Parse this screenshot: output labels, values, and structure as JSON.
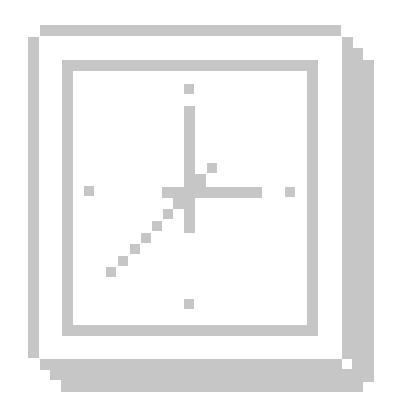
{
  "icon": {
    "name": "clock-icon",
    "style": "pixelated grayscale",
    "color": "#c6c6c6",
    "background": "#ffffff",
    "time_shown": "7:15",
    "shapes": {
      "outer_frame": [
        {
          "part": "top-bar",
          "x": 40,
          "y": 25,
          "w": 301,
          "h": 11
        },
        {
          "part": "left-bar",
          "x": 28,
          "y": 37,
          "w": 11,
          "h": 321
        },
        {
          "part": "right-shadow-1",
          "x": 342,
          "y": 37,
          "w": 11,
          "h": 322
        },
        {
          "part": "right-shadow-2",
          "x": 352,
          "y": 48,
          "w": 11,
          "h": 322
        },
        {
          "part": "right-shadow-3",
          "x": 363,
          "y": 60,
          "w": 11,
          "h": 322
        },
        {
          "part": "bottom-shadow-1",
          "x": 40,
          "y": 359,
          "w": 302,
          "h": 11
        },
        {
          "part": "bottom-shadow-2",
          "x": 50,
          "y": 369,
          "w": 313,
          "h": 11
        },
        {
          "part": "bottom-shadow-3",
          "x": 61,
          "y": 380,
          "w": 302,
          "h": 12
        }
      ],
      "inner_frame": [
        {
          "part": "top",
          "x": 62,
          "y": 60,
          "w": 256,
          "h": 11
        },
        {
          "part": "left",
          "x": 62,
          "y": 60,
          "w": 11,
          "h": 275
        },
        {
          "part": "right",
          "x": 307,
          "y": 60,
          "w": 11,
          "h": 275
        },
        {
          "part": "bottom",
          "x": 62,
          "y": 325,
          "w": 256,
          "h": 11
        }
      ],
      "hour_markers": [
        {
          "part": "12",
          "x": 184,
          "y": 84,
          "w": 10,
          "h": 10
        },
        {
          "part": "3",
          "x": 285,
          "y": 187,
          "w": 10,
          "h": 10
        },
        {
          "part": "6",
          "x": 184,
          "y": 299,
          "w": 10,
          "h": 10
        },
        {
          "part": "9",
          "x": 84,
          "y": 186,
          "w": 10,
          "h": 10
        }
      ],
      "hands": [
        {
          "part": "vertical-hand",
          "x": 184,
          "y": 106,
          "w": 11,
          "h": 127
        },
        {
          "part": "horizontal-hand",
          "x": 162,
          "y": 187,
          "w": 100,
          "h": 11
        },
        {
          "part": "hub-upper-right",
          "x": 195,
          "y": 174,
          "w": 11,
          "h": 13
        },
        {
          "part": "hub-dot",
          "x": 207,
          "y": 163,
          "w": 10,
          "h": 10
        },
        {
          "part": "hub-lower-left",
          "x": 173,
          "y": 197,
          "w": 11,
          "h": 12
        },
        {
          "part": "diag-1",
          "x": 163,
          "y": 209,
          "w": 10,
          "h": 10
        },
        {
          "part": "diag-2",
          "x": 152,
          "y": 221,
          "w": 10,
          "h": 10
        },
        {
          "part": "diag-3",
          "x": 141,
          "y": 233,
          "w": 10,
          "h": 10
        },
        {
          "part": "diag-4",
          "x": 130,
          "y": 244,
          "w": 10,
          "h": 10
        },
        {
          "part": "diag-5",
          "x": 118,
          "y": 256,
          "w": 10,
          "h": 10
        },
        {
          "part": "diag-6",
          "x": 106,
          "y": 267,
          "w": 10,
          "h": 10
        }
      ]
    }
  }
}
